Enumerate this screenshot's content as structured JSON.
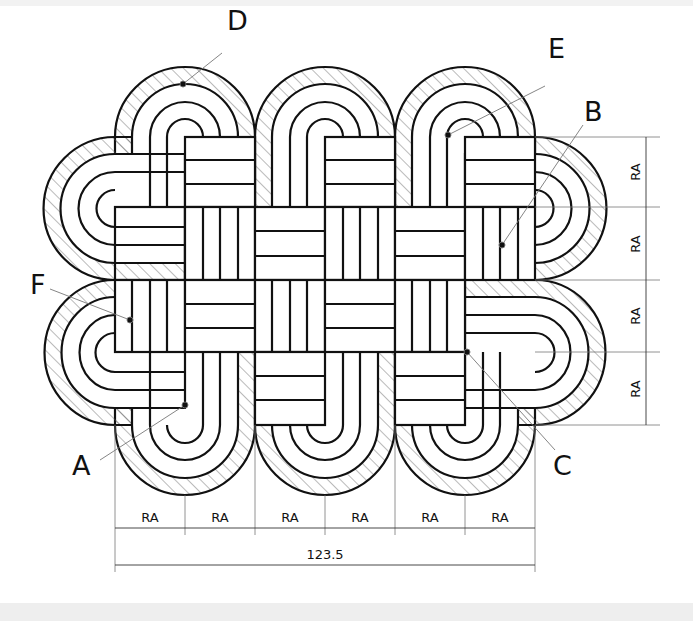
{
  "drawing": {
    "type": "technical drawing — woven knot with hatched section",
    "callouts": [
      {
        "id": "D",
        "label": "D"
      },
      {
        "id": "E",
        "label": "E"
      },
      {
        "id": "B",
        "label": "B"
      },
      {
        "id": "F",
        "label": "F"
      },
      {
        "id": "A",
        "label": "A"
      },
      {
        "id": "C",
        "label": "C"
      }
    ],
    "dimensions": {
      "horizontal_segments": [
        "RA",
        "RA",
        "RA",
        "RA",
        "RA",
        "RA"
      ],
      "vertical_segments": [
        "RA",
        "RA",
        "RA",
        "RA"
      ],
      "overall_width": "123.5"
    },
    "colors": {
      "line": "#111111",
      "hatch": "#555555",
      "background": "#ffffff"
    }
  }
}
